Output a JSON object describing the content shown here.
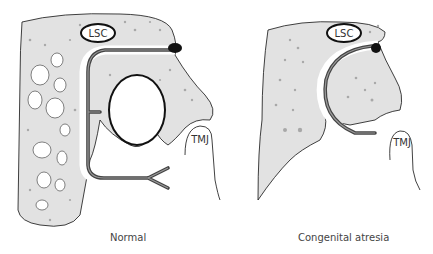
{
  "panels": [
    {
      "id": "normal",
      "caption": "Normal",
      "labels": {
        "lsc": "LSC",
        "tmj": "TMJ"
      }
    },
    {
      "id": "atresia",
      "caption": "Congenital atresia",
      "labels": {
        "lsc": "LSC",
        "tmj": "TMJ"
      }
    }
  ],
  "colors": {
    "bone": "#e2e2e2",
    "bone_spot": "#a8a8a8",
    "outline": "#111111",
    "nerve_dark": "#444444",
    "nerve_light": "#9a9a9a"
  }
}
